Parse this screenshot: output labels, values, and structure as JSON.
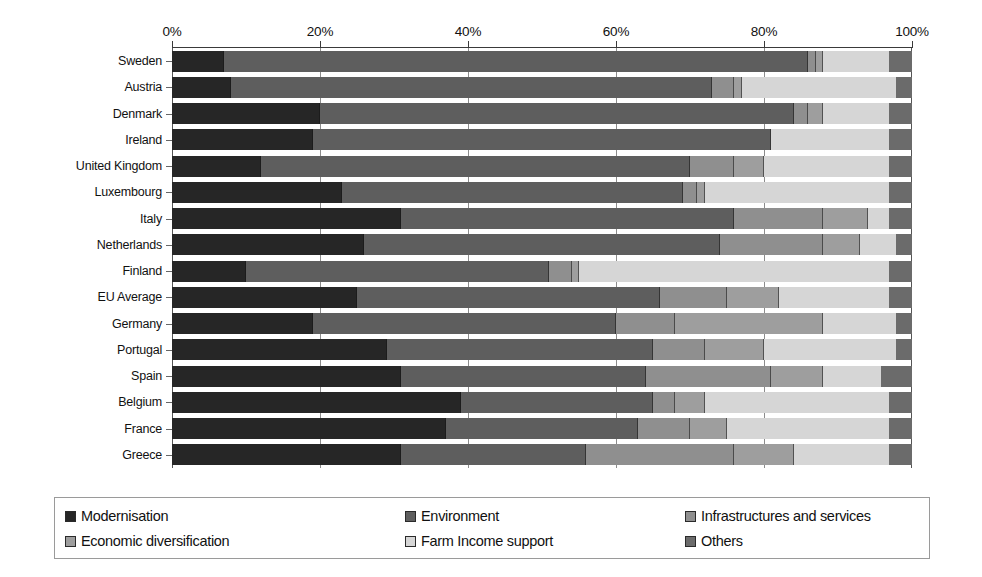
{
  "chart_data": {
    "type": "bar",
    "orientation": "horizontal",
    "stacked": true,
    "stack_mode": "percent",
    "title": "",
    "subtitle": "",
    "xlabel": "",
    "ylabel": "",
    "xlim": [
      0,
      100
    ],
    "xticks": [
      0,
      20,
      40,
      60,
      80,
      100
    ],
    "xtick_labels": [
      "0%",
      "20%",
      "40%",
      "60%",
      "80%",
      "100%"
    ],
    "grid": true,
    "grid_axis": "x",
    "legend_position": "bottom",
    "legend_columns": 3,
    "categories": [
      "Sweden",
      "Austria",
      "Denmark",
      "Ireland",
      "United Kingdom",
      "Luxembourg",
      "Italy",
      "Netherlands",
      "Finland",
      "EU Average",
      "Germany",
      "Portugal",
      "Spain",
      "Belgium",
      "France",
      "Greece"
    ],
    "series": [
      {
        "name": "Modernisation",
        "color": "#262626",
        "values": [
          7,
          8,
          20,
          19,
          12,
          23,
          31,
          26,
          10,
          25,
          19,
          29,
          31,
          39,
          37,
          31
        ]
      },
      {
        "name": "Environment",
        "color": "#5e5e5e",
        "values": [
          79,
          65,
          64,
          62,
          58,
          46,
          45,
          48,
          41,
          41,
          41,
          36,
          33,
          26,
          26,
          25
        ]
      },
      {
        "name": "Infrastructures and services",
        "color": "#8f8f8f",
        "values": [
          1,
          3,
          2,
          0,
          6,
          2,
          12,
          14,
          3,
          9,
          8,
          7,
          17,
          3,
          7,
          20
        ]
      },
      {
        "name": "Economic diversification",
        "color": "#9e9e9e",
        "values": [
          1,
          1,
          2,
          0,
          4,
          1,
          6,
          5,
          1,
          7,
          20,
          8,
          7,
          4,
          5,
          8
        ]
      },
      {
        "name": "Farm Income support",
        "color": "#d6d6d6",
        "values": [
          9,
          21,
          9,
          16,
          17,
          25,
          3,
          5,
          42,
          15,
          10,
          18,
          8,
          25,
          22,
          13
        ]
      },
      {
        "name": "Others",
        "color": "#6b6b6b",
        "values": [
          3,
          2,
          3,
          3,
          3,
          3,
          3,
          2,
          3,
          3,
          2,
          2,
          4,
          3,
          3,
          3
        ]
      }
    ]
  },
  "legend": {
    "items": [
      {
        "label": "Modernisation",
        "color": "#262626"
      },
      {
        "label": "Environment",
        "color": "#5e5e5e"
      },
      {
        "label": "Infrastructures and services",
        "color": "#8f8f8f"
      },
      {
        "label": "Economic diversification",
        "color": "#9e9e9e"
      },
      {
        "label": "Farm Income support",
        "color": "#d6d6d6"
      },
      {
        "label": "Others",
        "color": "#6b6b6b"
      }
    ]
  }
}
